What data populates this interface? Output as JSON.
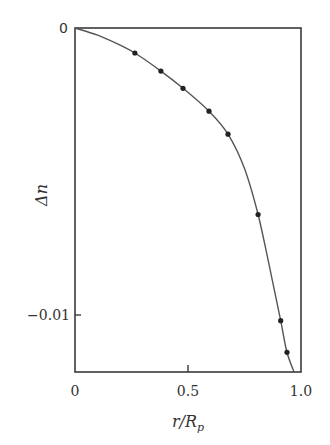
{
  "chart_data": {
    "type": "line",
    "title": "",
    "xlabel": "r/R_p",
    "ylabel": "Δn",
    "xlim": [
      0,
      1.0
    ],
    "ylim": [
      -0.012,
      0
    ],
    "grid": false,
    "legend": null,
    "x_ticks": [
      {
        "value": 0,
        "label": "0"
      },
      {
        "value": 0.5,
        "label": "0.5"
      },
      {
        "value": 1.0,
        "label": "1.0"
      }
    ],
    "y_ticks": [
      {
        "value": 0,
        "label": "0"
      },
      {
        "value": -0.01,
        "label": "−0.01"
      }
    ],
    "series": [
      {
        "name": "measured",
        "style": "markers",
        "x": [
          0.265,
          0.38,
          0.478,
          0.593,
          0.677,
          0.81,
          0.91,
          0.938
        ],
        "y": [
          -0.00087,
          -0.0015,
          -0.0021,
          -0.0029,
          -0.0037,
          -0.0065,
          -0.0102,
          -0.0113
        ]
      },
      {
        "name": "fit",
        "style": "line",
        "x": [
          0,
          0.1,
          0.2,
          0.265,
          0.38,
          0.478,
          0.593,
          0.677,
          0.75,
          0.81,
          0.86,
          0.91,
          0.938,
          0.97
        ],
        "y": [
          0,
          -0.00025,
          -0.0006,
          -0.00087,
          -0.0015,
          -0.0021,
          -0.0029,
          -0.0037,
          -0.0049,
          -0.0065,
          -0.0083,
          -0.0102,
          -0.0113,
          -0.012
        ]
      }
    ]
  },
  "labels": {
    "x_axis": "r/R",
    "x_axis_sub": "p",
    "y_axis": "Δn",
    "x_tick_0": "0",
    "x_tick_05": "0.5",
    "x_tick_1": "1.0",
    "y_tick_0": "0",
    "y_tick_m001": "−0.01"
  }
}
